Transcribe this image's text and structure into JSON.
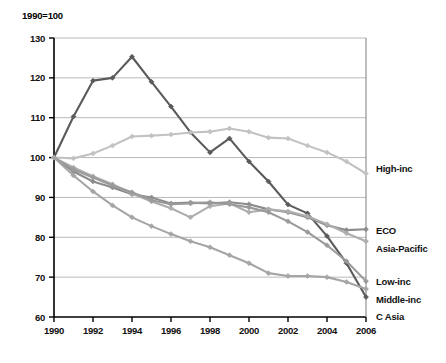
{
  "chart_data": {
    "type": "line",
    "title": "1990=100",
    "xlabel": "",
    "ylabel": "",
    "xlim": [
      1990,
      2006
    ],
    "ylim": [
      60,
      130
    ],
    "grid": true,
    "legend_position": "right-inline",
    "x": [
      1990,
      1991,
      1992,
      1993,
      1994,
      1995,
      1996,
      1997,
      1998,
      1999,
      2000,
      2001,
      2002,
      2003,
      2004,
      2005,
      2006
    ],
    "x_tick_labels": [
      "1990",
      "1992",
      "1994",
      "1996",
      "1998",
      "2000",
      "2002",
      "2004",
      "2006"
    ],
    "x_ticks": [
      1990,
      1992,
      1994,
      1996,
      1998,
      2000,
      2002,
      2004,
      2006
    ],
    "y_tick_labels": [
      "60",
      "70",
      "80",
      "90",
      "100",
      "110",
      "120",
      "130"
    ],
    "y_ticks": [
      60,
      70,
      80,
      90,
      100,
      110,
      120,
      130
    ],
    "series": [
      {
        "name": "C Asia",
        "label": "C Asia",
        "color": "#5a5a5a",
        "values": [
          100.0,
          110.3,
          119.3,
          120.0,
          125.3,
          119.0,
          112.8,
          106.3,
          101.3,
          104.8,
          99.0,
          94.0,
          88.2,
          86.0,
          80.3,
          73.5,
          65.0
        ]
      },
      {
        "name": "High-inc",
        "label": "High-inc",
        "color": "#c2c2c2",
        "values": [
          100.0,
          99.8,
          101.0,
          103.0,
          105.3,
          105.5,
          105.8,
          106.3,
          106.5,
          107.3,
          106.5,
          105.0,
          104.8,
          103.0,
          101.3,
          99.0,
          96.0
        ]
      },
      {
        "name": "ECO",
        "label": "ECO",
        "color": "#8c8c8c",
        "values": [
          100.0,
          96.5,
          94.0,
          92.5,
          90.8,
          90.0,
          88.5,
          88.7,
          88.5,
          88.8,
          88.3,
          87.0,
          86.3,
          85.0,
          83.0,
          81.8,
          82.0
        ]
      },
      {
        "name": "Asia-Pacific",
        "label": "Asia-Pacific",
        "color": "#adadad",
        "values": [
          100.0,
          97.5,
          95.3,
          93.3,
          91.0,
          89.0,
          87.3,
          85.0,
          87.8,
          88.5,
          86.3,
          87.0,
          86.5,
          85.3,
          83.3,
          81.0,
          79.0
        ]
      },
      {
        "name": "Low-inc",
        "label": "Low-inc",
        "color": "#9a9a9a",
        "values": [
          100.0,
          97.0,
          95.0,
          93.0,
          91.3,
          89.3,
          88.3,
          88.5,
          88.8,
          88.3,
          87.5,
          86.3,
          84.0,
          81.3,
          78.0,
          74.0,
          69.0
        ]
      },
      {
        "name": "Middle-inc",
        "label": "Middle-inc",
        "color": "#a5a5a5",
        "values": [
          100.0,
          95.5,
          91.5,
          88.0,
          85.0,
          82.8,
          80.8,
          79.0,
          77.5,
          75.5,
          73.5,
          71.0,
          70.3,
          70.3,
          70.0,
          68.8,
          67.0
        ]
      }
    ],
    "series_end_labels": [
      {
        "label": "High-inc",
        "value": 96.0,
        "label_y": 172
      },
      {
        "label": "ECO",
        "value": 82.0,
        "label_y": 234
      },
      {
        "label": "Asia-Pacific",
        "value": 79.0,
        "label_y": 252
      },
      {
        "label": "Low-inc",
        "value": 69.0,
        "label_y": 285
      },
      {
        "label": "Middle-inc",
        "value": 67.0,
        "label_y": 303
      },
      {
        "label": "C Asia",
        "value": 65.0,
        "label_y": 320
      }
    ]
  }
}
